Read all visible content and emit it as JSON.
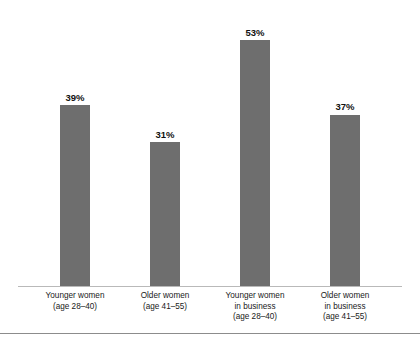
{
  "chart_data": {
    "type": "bar",
    "title": "",
    "subtitle": "",
    "xlabel": "",
    "ylabel": "",
    "ylim": [
      0,
      60
    ],
    "grid": false,
    "legend": null,
    "bar_color": "#6e6e6e",
    "axis_color": "#b9b9b9",
    "value_suffix": "%",
    "categories": [
      "Younger women (age 28–40)",
      "Older women (age 41–55)",
      "Younger women in business (age 28–40)",
      "Older women in business (age 41–55)"
    ],
    "category_lines": [
      [
        "Younger women",
        "(age 28–40)"
      ],
      [
        "Older women",
        "(age 41–55)"
      ],
      [
        "Younger women",
        "in business",
        "(age 28–40)"
      ],
      [
        "Older women",
        "in business",
        "(age 41–55)"
      ]
    ],
    "values": [
      39,
      31,
      53,
      37
    ],
    "value_labels": [
      "39%",
      "31%",
      "53%",
      "37%"
    ]
  }
}
